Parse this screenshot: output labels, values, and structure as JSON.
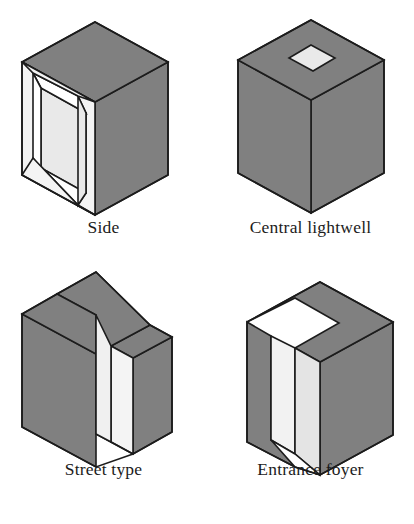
{
  "figure": {
    "background_color": "#ffffff",
    "palette": {
      "face_dark": "#808080",
      "face_mid": "#9a9a9a",
      "face_light": "#e9e9e9",
      "face_lightest": "#f4f4f4",
      "outline": "#1c1c1c",
      "label_color": "#1b1b1b"
    },
    "panels": [
      {
        "id": "side",
        "label": "Side",
        "icon": "isometric-cube-side-void",
        "description": "Isometric block with a large rectangular void recessed into the left face"
      },
      {
        "id": "central-lightwell",
        "label": "Central lightwell",
        "icon": "isometric-cube-central-lightwell",
        "description": "Isometric block with a small square lightwell opening in the centre of the roof"
      },
      {
        "id": "street-type",
        "label": "Street type",
        "icon": "isometric-cube-street-slot",
        "description": "Isometric block split by a full-height linear slot running front to back"
      },
      {
        "id": "entrance-foyer",
        "label": "Entrance foyer",
        "icon": "isometric-cube-entrance-notch",
        "description": "Isometric block with an L-shaped notch cut from the front corner forming a foyer"
      }
    ]
  }
}
